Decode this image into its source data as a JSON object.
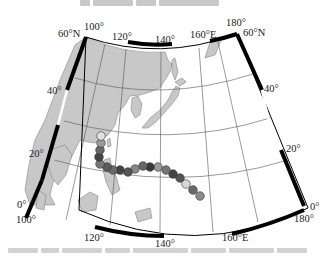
{
  "figure": {
    "caption_top": "",
    "caption_bottom": ""
  },
  "map": {
    "projection": "Lambert conic",
    "extent": {
      "lon_min": 100,
      "lon_max": 180,
      "lat_min": 0,
      "lat_max": 60
    },
    "labels": {
      "top_lon_100": "100°",
      "top_lon_120": "120°",
      "top_lon_140": "140°",
      "top_lon_160": "160°E",
      "top_lon_180": "180°",
      "top_left_lat": "60°N",
      "top_right_lat": "60°N",
      "left_lat_40": "40°",
      "left_lat_20": "20°",
      "left_lat_0": "0°",
      "right_lat_40": "40°",
      "right_lat_20": "20°",
      "right_lat_0": "0°",
      "bottom_lon_100": "100°",
      "bottom_lon_120": "120°",
      "bottom_lon_140": "140°",
      "bottom_lon_160": "160°E",
      "bottom_lon_180": "180°"
    },
    "colors": {
      "land": "#c8c8c8",
      "ocean": "#ffffff",
      "frame": "#000000",
      "grid": "#555555",
      "track_dark": "#555555",
      "track_light": "#bbbbbb"
    },
    "typhoon_track": {
      "points": [
        {
          "x": 200,
          "y": 196,
          "shade": "#8a8a8a"
        },
        {
          "x": 193,
          "y": 190,
          "shade": "#6a6a6a"
        },
        {
          "x": 186,
          "y": 184,
          "shade": "#d8d8d8"
        },
        {
          "x": 180,
          "y": 178,
          "shade": "#555555"
        },
        {
          "x": 173,
          "y": 174,
          "shade": "#444444"
        },
        {
          "x": 166,
          "y": 170,
          "shade": "#777777"
        },
        {
          "x": 158,
          "y": 167,
          "shade": "#999999"
        },
        {
          "x": 150,
          "y": 167,
          "shade": "#3a3a3a"
        },
        {
          "x": 143,
          "y": 166,
          "shade": "#666666"
        },
        {
          "x": 135,
          "y": 169,
          "shade": "#888888"
        },
        {
          "x": 128,
          "y": 172,
          "shade": "#555555"
        },
        {
          "x": 120,
          "y": 170,
          "shade": "#444444"
        },
        {
          "x": 113,
          "y": 170,
          "shade": "#6a6a6a"
        },
        {
          "x": 107,
          "y": 167,
          "shade": "#5a5a5a"
        },
        {
          "x": 100,
          "y": 164,
          "shade": "#777777"
        },
        {
          "x": 99,
          "y": 157,
          "shade": "#444444"
        },
        {
          "x": 100,
          "y": 150,
          "shade": "#666666"
        },
        {
          "x": 101,
          "y": 143,
          "shade": "#999999"
        },
        {
          "x": 101,
          "y": 136,
          "shade": "#e0e0e0"
        }
      ]
    }
  }
}
